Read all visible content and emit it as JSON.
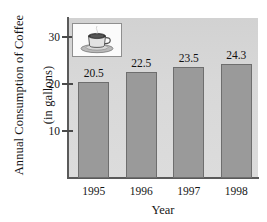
{
  "chart_data": {
    "type": "bar",
    "title": "",
    "categories": [
      "1995",
      "1996",
      "1997",
      "1998"
    ],
    "values": [
      20.5,
      22.5,
      23.5,
      24.3
    ],
    "value_labels": [
      "20.5",
      "22.5",
      "23.5",
      "24.3"
    ],
    "xlabel": "Year",
    "ylabel": "Annual Consumption of Coffee (in gallons)",
    "ylabel_line1": "Annual Consumption of Coffee",
    "ylabel_line2": "(in gallons)",
    "ylim": [
      0,
      34
    ],
    "yticks": [
      10,
      20,
      30
    ],
    "ytick_labels": [
      "10",
      "20",
      "30"
    ],
    "grid": false,
    "legend": null,
    "bar_color": "#9a9a9a",
    "bar_edge_color": "#6e6e6e",
    "plot_background": "#d8d8d8",
    "axis_color": "#5a5a5a",
    "text_color": "#161616"
  },
  "inset": {
    "name": "coffee-cup-illustration",
    "description": "coffee cup on saucer with steam",
    "border_color": "#8f8f8f",
    "background": "#fbfbfb"
  }
}
